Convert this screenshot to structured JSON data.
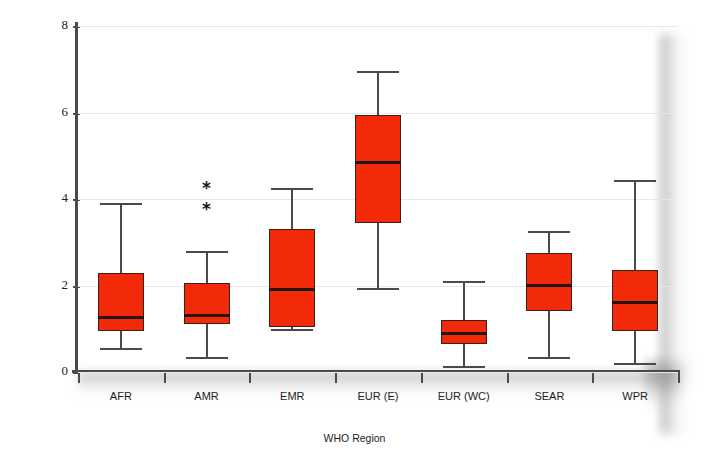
{
  "chart_data": {
    "type": "box",
    "title": "",
    "xlabel": "WHO Region",
    "ylabel": "% any resistance",
    "ylim": [
      0,
      8
    ],
    "yticks": [
      0,
      2,
      4,
      6,
      8
    ],
    "ytick_labels": [
      "0",
      "2",
      "4",
      "6",
      "8"
    ],
    "grid": true,
    "grid_axis": "y",
    "legend": "none",
    "categories": [
      "AFR",
      "AMR",
      "EMR",
      "EUR (E)",
      "EUR (WC)",
      "SEAR",
      "WPR"
    ],
    "box_color": "#F22A0A",
    "box_edge_color": "#3A2018",
    "median_color": "#231510",
    "whisker_color": "#4A4A4A",
    "outlier_marker": "*",
    "boxes": [
      {
        "category": "AFR",
        "whisker_low": 0.55,
        "q1": 0.95,
        "median": 1.25,
        "q3": 2.3,
        "whisker_high": 3.9,
        "outliers": []
      },
      {
        "category": "AMR",
        "whisker_low": 0.35,
        "q1": 1.1,
        "median": 1.3,
        "q3": 2.05,
        "whisker_high": 2.8,
        "outliers": [
          3.85,
          4.35
        ]
      },
      {
        "category": "EMR",
        "whisker_low": 1.0,
        "q1": 1.05,
        "median": 1.9,
        "q3": 3.3,
        "whisker_high": 4.25,
        "outliers": []
      },
      {
        "category": "EUR (E)",
        "whisker_low": 1.95,
        "q1": 3.45,
        "median": 4.85,
        "q3": 5.95,
        "whisker_high": 6.95,
        "outliers": []
      },
      {
        "category": "EUR (WC)",
        "whisker_low": 0.15,
        "q1": 0.65,
        "median": 0.9,
        "q3": 1.2,
        "whisker_high": 2.1,
        "outliers": []
      },
      {
        "category": "SEAR",
        "whisker_low": 0.35,
        "q1": 1.4,
        "median": 2.0,
        "q3": 2.75,
        "whisker_high": 3.25,
        "outliers": []
      },
      {
        "category": "WPR",
        "whisker_low": 0.2,
        "q1": 0.95,
        "median": 1.6,
        "q3": 2.35,
        "whisker_high": 4.45,
        "outliers": []
      }
    ]
  }
}
